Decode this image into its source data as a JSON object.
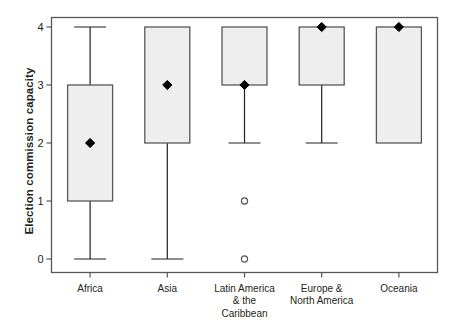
{
  "chart_data": {
    "type": "box",
    "title": "",
    "xlabel": "",
    "ylabel": "Election commission capacity",
    "ylim": [
      0,
      4
    ],
    "yticks": [
      0,
      1,
      2,
      3,
      4
    ],
    "ytick_labels": [
      "0",
      "1",
      "2",
      "3",
      "4"
    ],
    "grid": false,
    "legend": false,
    "frame": true,
    "marker_note": "filled black diamond denotes the mean; open circles denote outliers",
    "categories": [
      "Africa",
      "Latin America & the Caribbean",
      "Asia",
      "Europe & North America",
      "Oceania"
    ],
    "boxes": [
      {
        "category": "Africa",
        "label_lines": [
          "Africa"
        ],
        "whisker_low": 0,
        "q1": 1,
        "median": 3,
        "q3": 3,
        "whisker_high": 4,
        "mean": 2,
        "outliers": []
      },
      {
        "category": "Asia",
        "label_lines": [
          "Asia"
        ],
        "whisker_low": 0,
        "q1": 2,
        "median": 4,
        "q3": 4,
        "whisker_high": 4,
        "mean": 3,
        "outliers": []
      },
      {
        "category": "Latin America & the Caribbean",
        "label_lines": [
          "Latin America",
          "& the",
          "Caribbean"
        ],
        "whisker_low": 2,
        "q1": 3,
        "median": 4,
        "q3": 4,
        "whisker_high": 4,
        "mean": 3,
        "outliers": [
          1,
          0
        ]
      },
      {
        "category": "Europe & North America",
        "label_lines": [
          "Europe &",
          "North America"
        ],
        "whisker_low": 2,
        "q1": 3,
        "median": 4,
        "q3": 4,
        "whisker_high": 4,
        "mean": 4,
        "outliers": []
      },
      {
        "category": "Oceania",
        "label_lines": [
          "Oceania"
        ],
        "whisker_low": 2,
        "q1": 2,
        "median": 4,
        "q3": 4,
        "whisker_high": 4,
        "mean": 4,
        "outliers": []
      }
    ],
    "colors": {
      "box_fill": "#eeeeee",
      "box_stroke": "#58585a",
      "whisker": "#231f20",
      "marker": "#000000",
      "outlier_stroke": "#58585a",
      "axis": "#58585a",
      "text": "#231f20",
      "background": "#ffffff"
    }
  }
}
